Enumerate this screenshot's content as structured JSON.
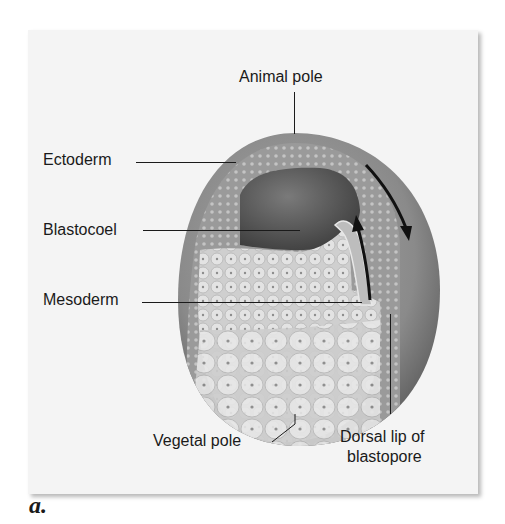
{
  "figure": {
    "panel_letter": "a.",
    "labels": {
      "animal_pole": "Animal pole",
      "ectoderm": "Ectoderm",
      "blastocoel": "Blastocoel",
      "mesoderm": "Mesoderm",
      "vegetal_pole": "Vegetal pole",
      "dorsal_lip_line1": "Dorsal lip of",
      "dorsal_lip_line2": "blastopore"
    },
    "colors": {
      "card_background": "#f4f4f4",
      "outer_ectoderm": "#8a8a8a",
      "blastocoel_cavity": "#555555",
      "endoderm_cells": "#d6d6d6",
      "text": "#1a1a1a"
    }
  }
}
